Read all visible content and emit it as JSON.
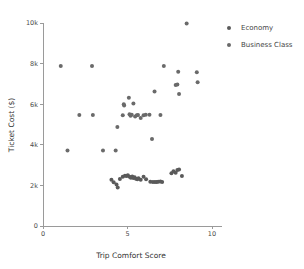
{
  "chart_data": {
    "type": "scatter",
    "title": "",
    "xlabel": "Trip Comfort Score",
    "ylabel": "Ticket Cost ($)",
    "xlim": [
      0,
      10.6
    ],
    "ylim": [
      0,
      10000
    ],
    "xticks": [
      0,
      5,
      10
    ],
    "xticklabels": [
      "0",
      "5",
      "10"
    ],
    "yticks": [
      0,
      2000,
      4000,
      6000,
      8000,
      10000
    ],
    "yticklabels": [
      "0",
      "2k",
      "4k",
      "6k",
      "8k",
      "10k"
    ],
    "grid": false,
    "legend_position": "right",
    "series": [
      {
        "name": "Economy",
        "color": "#5a5a5a",
        "marker": "circle",
        "marker_size": 3.0,
        "points": [
          [
            4.05,
            2280
          ],
          [
            4.18,
            2150
          ],
          [
            4.35,
            2050
          ],
          [
            4.42,
            1900
          ],
          [
            4.55,
            2320
          ],
          [
            4.72,
            2420
          ],
          [
            4.85,
            2480
          ],
          [
            4.95,
            2460
          ],
          [
            5.02,
            2500
          ],
          [
            5.12,
            2430
          ],
          [
            5.2,
            2380
          ],
          [
            5.28,
            2440
          ],
          [
            5.35,
            2360
          ],
          [
            5.42,
            2400
          ],
          [
            5.5,
            2330
          ],
          [
            5.58,
            2300
          ],
          [
            5.65,
            2350
          ],
          [
            5.78,
            2280
          ],
          [
            5.95,
            2420
          ],
          [
            6.1,
            2300
          ],
          [
            6.35,
            2180
          ],
          [
            6.5,
            2170
          ],
          [
            6.62,
            2170
          ],
          [
            6.72,
            2170
          ],
          [
            6.82,
            2180
          ],
          [
            6.95,
            2190
          ],
          [
            7.05,
            2170
          ],
          [
            7.6,
            2600
          ],
          [
            7.72,
            2700
          ],
          [
            7.85,
            2620
          ],
          [
            7.95,
            2760
          ],
          [
            8.05,
            2780
          ],
          [
            8.22,
            2460
          ]
        ]
      },
      {
        "name": "Business Class",
        "color": "#6a6a6a",
        "marker": "circle",
        "marker_size": 3.0,
        "points": [
          [
            1.05,
            7880
          ],
          [
            1.45,
            3720
          ],
          [
            2.15,
            5470
          ],
          [
            2.9,
            7880
          ],
          [
            2.95,
            5470
          ],
          [
            3.55,
            3720
          ],
          [
            4.3,
            3720
          ],
          [
            4.4,
            4880
          ],
          [
            4.72,
            5450
          ],
          [
            4.78,
            6000
          ],
          [
            4.8,
            5930
          ],
          [
            5.08,
            6320
          ],
          [
            5.12,
            5500
          ],
          [
            5.18,
            5430
          ],
          [
            5.25,
            5480
          ],
          [
            5.35,
            6030
          ],
          [
            5.45,
            5400
          ],
          [
            5.55,
            5450
          ],
          [
            5.62,
            5470
          ],
          [
            5.78,
            5320
          ],
          [
            5.95,
            5460
          ],
          [
            6.08,
            5480
          ],
          [
            6.3,
            5480
          ],
          [
            6.45,
            4280
          ],
          [
            6.6,
            6620
          ],
          [
            6.95,
            5470
          ],
          [
            7.15,
            7880
          ],
          [
            7.85,
            6950
          ],
          [
            7.95,
            6970
          ],
          [
            8.0,
            7600
          ],
          [
            8.05,
            6500
          ],
          [
            8.5,
            9980
          ],
          [
            9.1,
            7580
          ],
          [
            9.15,
            7080
          ]
        ]
      }
    ]
  }
}
